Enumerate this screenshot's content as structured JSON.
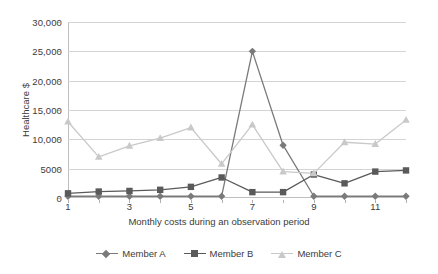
{
  "chart_data": {
    "type": "line",
    "title": "",
    "xlabel": "Monthly costs during an observation period",
    "ylabel": "Healthcare $",
    "x": [
      1,
      2,
      3,
      4,
      5,
      6,
      7,
      8,
      9,
      10,
      11,
      12
    ],
    "xtick_labels": [
      "1",
      "3",
      "5",
      "7",
      "9",
      "11"
    ],
    "xtick_values": [
      1,
      3,
      5,
      7,
      9,
      11
    ],
    "xlim": [
      1,
      12
    ],
    "ylim": [
      0,
      30000
    ],
    "ytick_labels": [
      "0",
      "5000",
      "10,000",
      "15,000",
      "20,000",
      "25,000",
      "30,000"
    ],
    "ytick_values": [
      0,
      5000,
      10000,
      15000,
      20000,
      25000,
      30000
    ],
    "grid": "horizontal",
    "legend_position": "bottom",
    "series": [
      {
        "name": "Member A",
        "marker": "diamond",
        "color": "#7a7a7a",
        "values": [
          300,
          300,
          300,
          300,
          300,
          300,
          25000,
          9000,
          300,
          300,
          300,
          300
        ]
      },
      {
        "name": "Member B",
        "marker": "square",
        "color": "#5a5a5a",
        "values": [
          800,
          1100,
          1200,
          1400,
          1900,
          3500,
          1000,
          1000,
          4000,
          2500,
          4500,
          4700
        ]
      },
      {
        "name": "Member C",
        "marker": "triangle",
        "color": "#c9c9c9",
        "values": [
          13000,
          7000,
          8900,
          10200,
          12000,
          5800,
          12500,
          4500,
          4200,
          9500,
          9200,
          13300
        ]
      }
    ]
  },
  "legend": {
    "items": [
      {
        "label": "Member A"
      },
      {
        "label": "Member B"
      },
      {
        "label": "Member C"
      }
    ]
  }
}
